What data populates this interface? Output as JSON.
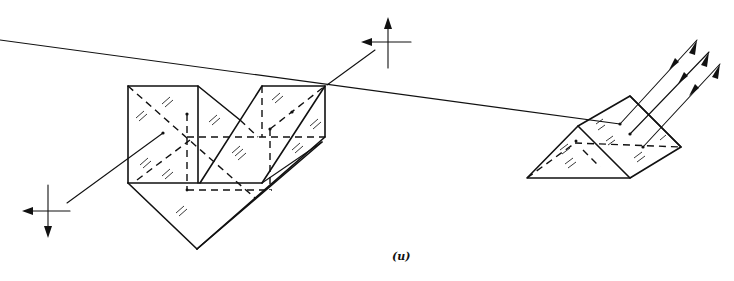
{
  "figure": {
    "label": "(u)",
    "colors": {
      "ink": "#111111",
      "background": "#ffffff"
    }
  },
  "left_assembly": {
    "name": "prism-assembly-left",
    "crosshair_in": {
      "center": [
        48,
        211
      ],
      "arrows": [
        "left",
        "down"
      ]
    },
    "crosshair_out": {
      "center": [
        388,
        42
      ],
      "arrows": [
        "left",
        "up"
      ]
    },
    "ray": {
      "from": [
        67,
        203
      ],
      "to": [
        375,
        50
      ]
    }
  },
  "right_assembly": {
    "name": "triangular-prism-right",
    "rays": 3,
    "ray_arrows": "double (out and back)"
  }
}
